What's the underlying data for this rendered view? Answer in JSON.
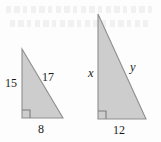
{
  "figure": {
    "background_color": "#fdfdfd",
    "fill_color": "#cdcdcd",
    "stroke_color": "#8f8f8f",
    "text_color": "#1b1b1b"
  },
  "triangles": [
    {
      "id": "left-triangle",
      "name": "small-right-triangle",
      "right_angle_vertex": "bottom-left",
      "labels": {
        "vertical_leg": "15",
        "hypotenuse": "17",
        "base": "8"
      },
      "geometry": {
        "apex": [
          22,
          49
        ],
        "bottom_left": [
          22,
          118
        ],
        "bottom_right": [
          63,
          118
        ]
      }
    },
    {
      "id": "right-triangle",
      "name": "large-right-triangle",
      "right_angle_vertex": "bottom-left",
      "labels": {
        "vertical_leg": "x",
        "hypotenuse": "y",
        "base": "12"
      },
      "geometry": {
        "apex": [
          98,
          14
        ],
        "bottom_left": [
          98,
          119
        ],
        "bottom_right": [
          146,
          119
        ]
      }
    }
  ]
}
